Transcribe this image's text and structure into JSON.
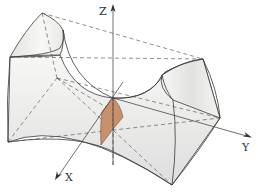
{
  "figure": {
    "type": "3d-surface-diagram",
    "axes": [
      {
        "name": "z-axis",
        "label": "Z"
      },
      {
        "name": "x-axis",
        "label": "X"
      },
      {
        "name": "y-axis",
        "label": "Y"
      }
    ],
    "colors": {
      "surface_fill": "#f1f1ef",
      "surface_shade": "#d9d9d6",
      "edge": "#3a3a3a",
      "section_fill": "#c8916e",
      "section_edge": "#7a4a30"
    },
    "caption_partial": "Figure caption (cut off at bottom edge)"
  }
}
